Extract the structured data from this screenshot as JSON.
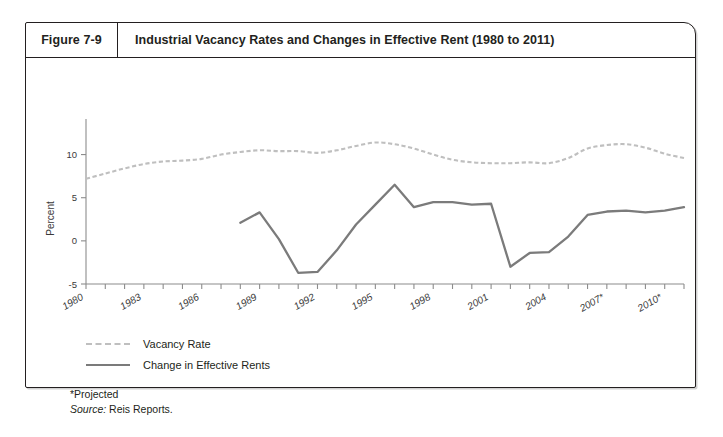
{
  "figure": {
    "number": "Figure 7-9",
    "title": "Industrial Vacancy Rates and Changes in Effective Rent (1980 to 2011)"
  },
  "legend": {
    "items": [
      {
        "label": "Vacancy Rate",
        "color": "#bfbfbf",
        "style": "dashed"
      },
      {
        "label": "Change in Effective Rents",
        "color": "#7b7b7b",
        "style": "solid"
      }
    ]
  },
  "footnotes": {
    "projected": "*Projected",
    "source_prefix": "Source:",
    "source_value": "Reis Reports."
  },
  "chart_data": {
    "type": "line",
    "title": "Industrial Vacancy Rates and Changes in Effective Rent (1980 to 2011)",
    "xlabel": "",
    "ylabel": "Percent",
    "ylim": [
      -5,
      12.5
    ],
    "yticks": [
      -5,
      0,
      5,
      10
    ],
    "ytick_labels": [
      "-5",
      "0",
      "5",
      "10"
    ],
    "xlim": [
      1980,
      2011
    ],
    "xtick_labels": [
      "1980",
      "1983",
      "1986",
      "1989",
      "1992",
      "1995",
      "1998",
      "2001",
      "2004",
      "2007*",
      "2010*"
    ],
    "xtick_years": [
      1980,
      1983,
      1986,
      1989,
      1992,
      1995,
      1998,
      2001,
      2004,
      2007,
      2010
    ],
    "grid": false,
    "legend_position": "below-left",
    "x": [
      1980,
      1981,
      1982,
      1983,
      1984,
      1985,
      1986,
      1987,
      1988,
      1989,
      1990,
      1991,
      1992,
      1993,
      1994,
      1995,
      1996,
      1997,
      1998,
      1999,
      2000,
      2001,
      2002,
      2003,
      2004,
      2005,
      2006,
      2007,
      2008,
      2009,
      2010,
      2011
    ],
    "series": [
      {
        "name": "Vacancy Rate",
        "color": "#bfbfbf",
        "style": "dashed",
        "x": [
          1980,
          1981,
          1982,
          1983,
          1984,
          1985,
          1986,
          1987,
          1988,
          1989,
          1990,
          1991,
          1992,
          1993,
          1994,
          1995,
          1996,
          1997,
          1998,
          1999,
          2000,
          2001,
          2002,
          2003,
          2004,
          2005,
          2006,
          2007,
          2008,
          2009,
          2010,
          2011
        ],
        "values": [
          7.2,
          7.8,
          8.4,
          8.9,
          9.2,
          9.3,
          9.5,
          10.0,
          10.3,
          10.5,
          10.4,
          10.4,
          10.2,
          10.5,
          11.0,
          11.4,
          11.2,
          10.7,
          10.0,
          9.4,
          9.1,
          9.0,
          9.0,
          9.1,
          9.0,
          9.6,
          10.7,
          11.1,
          11.2,
          10.8,
          10.1,
          9.6
        ]
      },
      {
        "name": "Change in Effective Rents",
        "color": "#7b7b7b",
        "style": "solid",
        "x": [
          1988,
          1989,
          1990,
          1991,
          1992,
          1993,
          1994,
          1995,
          1996,
          1997,
          1998,
          1999,
          2000,
          2001,
          2002,
          2003,
          2004,
          2005,
          2006,
          2007,
          2008,
          2009,
          2010,
          2011
        ],
        "values": [
          2.1,
          3.3,
          0.2,
          -3.7,
          -3.6,
          -1.1,
          1.9,
          4.2,
          6.5,
          3.9,
          4.5,
          4.5,
          4.2,
          4.3,
          -3.0,
          -1.4,
          -1.3,
          0.5,
          3.0,
          3.4,
          3.5,
          3.3,
          3.5,
          3.9
        ]
      }
    ]
  }
}
